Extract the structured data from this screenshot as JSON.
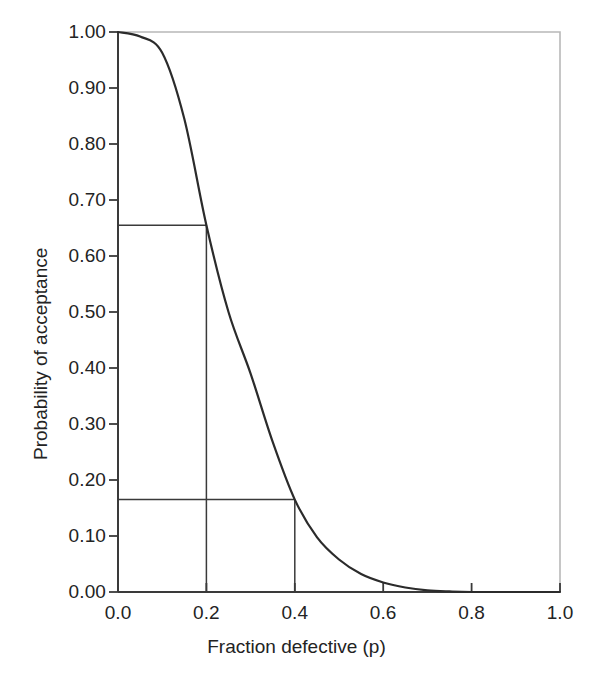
{
  "chart_data": {
    "type": "line",
    "title": "",
    "subtitle": "",
    "xlabel": "Fraction defective (p)",
    "ylabel": "Probability of acceptance",
    "xlim": [
      0.0,
      1.0
    ],
    "ylim": [
      0.0,
      1.0
    ],
    "grid": false,
    "legend": null,
    "legend_position": "none",
    "xticks": [
      "0.0",
      "0.2",
      "0.4",
      "0.6",
      "0.8",
      "1.0"
    ],
    "xtick_values": [
      0.0,
      0.2,
      0.4,
      0.6,
      0.8,
      1.0
    ],
    "yticks": [
      "0.00",
      "0.10",
      "0.20",
      "0.30",
      "0.40",
      "0.50",
      "0.60",
      "0.70",
      "0.80",
      "0.90",
      "1.00"
    ],
    "ytick_values": [
      0.0,
      0.1,
      0.2,
      0.3,
      0.4,
      0.5,
      0.6,
      0.7,
      0.8,
      0.9,
      1.0
    ],
    "series": [
      {
        "name": "Operating characteristic curve",
        "color": "#2b2b2b",
        "x": [
          0.0,
          0.02,
          0.04,
          0.06,
          0.08,
          0.1,
          0.12,
          0.14,
          0.16,
          0.18,
          0.2,
          0.22,
          0.24,
          0.26,
          0.28,
          0.3,
          0.32,
          0.34,
          0.36,
          0.38,
          0.4,
          0.42,
          0.44,
          0.46,
          0.48,
          0.5,
          0.52,
          0.54,
          0.56,
          0.58,
          0.6,
          0.62,
          0.64,
          0.66,
          0.68,
          0.7,
          0.72,
          0.74,
          0.76,
          0.78,
          0.8,
          0.85,
          0.9,
          0.95,
          1.0
        ],
        "y": [
          1.0,
          0.999,
          0.996,
          0.99,
          0.979,
          0.963,
          0.941,
          0.913,
          0.878,
          0.838,
          0.655,
          0.742,
          0.688,
          0.632,
          0.574,
          0.516,
          0.459,
          0.404,
          0.351,
          0.302,
          0.165,
          0.215,
          0.179,
          0.147,
          0.119,
          0.095,
          0.075,
          0.058,
          0.044,
          0.033,
          0.024,
          0.017,
          0.012,
          0.008,
          0.005,
          0.003,
          0.002,
          0.001,
          0.001,
          0.0,
          0.0,
          0.0,
          0.0,
          0.0,
          0.0
        ]
      }
    ],
    "annotations": [
      {
        "name": "producers-risk",
        "p": 0.2,
        "pa": 0.655,
        "type": "crosshair"
      },
      {
        "name": "consumers-risk",
        "p": 0.4,
        "pa": 0.165,
        "type": "crosshair"
      }
    ]
  },
  "axes": {
    "x_title": "Fraction defective (p)",
    "y_title": "Probability of acceptance",
    "x_tick_labels": [
      "0.0",
      "0.2",
      "0.4",
      "0.6",
      "0.8",
      "1.0"
    ],
    "y_tick_labels": [
      "0.00",
      "0.10",
      "0.20",
      "0.30",
      "0.40",
      "0.50",
      "0.60",
      "0.70",
      "0.80",
      "0.90",
      "1.00"
    ]
  },
  "colors": {
    "curve": "#2b2b2b",
    "axis": "#3a3a3a",
    "frame_light": "#b8b8b8",
    "annotation": "#3a3a3a",
    "text": "#232323",
    "background": "#ffffff"
  }
}
